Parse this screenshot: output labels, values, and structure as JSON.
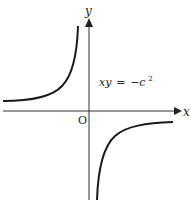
{
  "diagram": {
    "axes": {
      "x_label": "x",
      "y_label": "y",
      "origin_label": "O"
    },
    "equation": {
      "lhs": "xy",
      "eq": "=",
      "rhs": "−c",
      "exponent": "2"
    },
    "curves": [
      {
        "name": "upper-left-branch",
        "quadrant": "II"
      },
      {
        "name": "lower-right-branch",
        "quadrant": "IV"
      }
    ],
    "colors": {
      "ink": "#222222",
      "background": "#ffffff"
    }
  }
}
